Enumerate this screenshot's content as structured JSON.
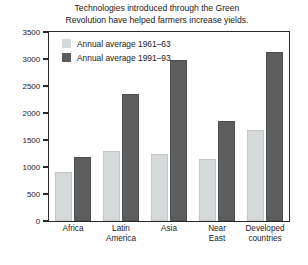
{
  "chart_data": {
    "type": "bar",
    "title": "Technologies introduced through the Green Revolution have helped farmers increase yields.",
    "title_lines": [
      "Technologies introduced through the Green",
      "Revolution have helped farmers increase yields."
    ],
    "xlabel": "",
    "ylabel": "",
    "ylim": [
      0,
      3500
    ],
    "ytick_step": 500,
    "yticks": [
      3500,
      3000,
      2500,
      2000,
      1500,
      1000,
      500,
      0
    ],
    "ytick_labels": [
      "3500",
      "3000",
      "2500",
      "2000",
      "1500",
      "1000",
      "500",
      "0"
    ],
    "grid": false,
    "legend_position": "top-left-inside",
    "categories": [
      "Africa",
      "Latin America",
      "Asia",
      "Near East",
      "Developed countries"
    ],
    "category_lines": [
      [
        "Africa"
      ],
      [
        "Latin",
        "America"
      ],
      [
        "Asia"
      ],
      [
        "Near",
        "East"
      ],
      [
        "Developed",
        "countries"
      ]
    ],
    "series": [
      {
        "name": "Annual average 1961–63",
        "color": "#d6d9d9",
        "values": [
          900,
          1290,
          1240,
          1140,
          1690
        ]
      },
      {
        "name": "Annual average 1991–93",
        "color": "#5b5d5f",
        "values": [
          1180,
          2350,
          2990,
          1850,
          3130
        ]
      }
    ]
  },
  "legend": {
    "items": [
      {
        "label": "Annual average 1961–63",
        "color": "#d6d9d9"
      },
      {
        "label": "Annual average 1991–93",
        "color": "#5b5d5f"
      }
    ]
  },
  "colors": {
    "background": "#ffffff",
    "axis": "#2a2a2a",
    "text": "#1a1a1a",
    "series_light": "#d6d9d9",
    "series_dark": "#5b5d5f"
  }
}
